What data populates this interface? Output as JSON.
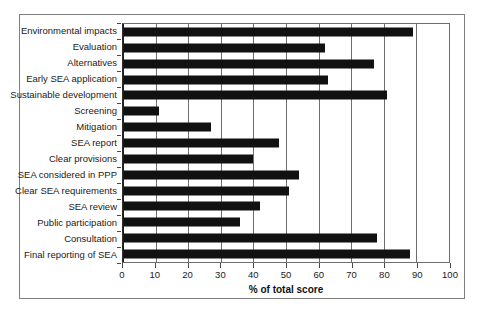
{
  "chart_data": {
    "type": "bar",
    "orientation": "horizontal",
    "title": "",
    "xlabel": "% of total score",
    "ylabel": "",
    "xlim": [
      0,
      100
    ],
    "xticks": [
      0,
      10,
      20,
      30,
      40,
      50,
      60,
      70,
      80,
      90,
      100
    ],
    "grid": "vertical",
    "legend": "none",
    "bar_color": "#111111",
    "categories": [
      "Environmental impacts",
      "Evaluation",
      "Alternatives",
      "Early SEA application",
      "Sustainable development",
      "Screening",
      "Mitigation",
      "SEA report",
      "Clear provisions",
      "SEA considered in PPP",
      "Clear SEA requirements",
      "SEA review",
      "Public participation",
      "Consultation",
      "Final reporting of SEA"
    ],
    "values": [
      89,
      62,
      77,
      63,
      81,
      11,
      27,
      48,
      40,
      54,
      51,
      42,
      36,
      78,
      88
    ]
  }
}
